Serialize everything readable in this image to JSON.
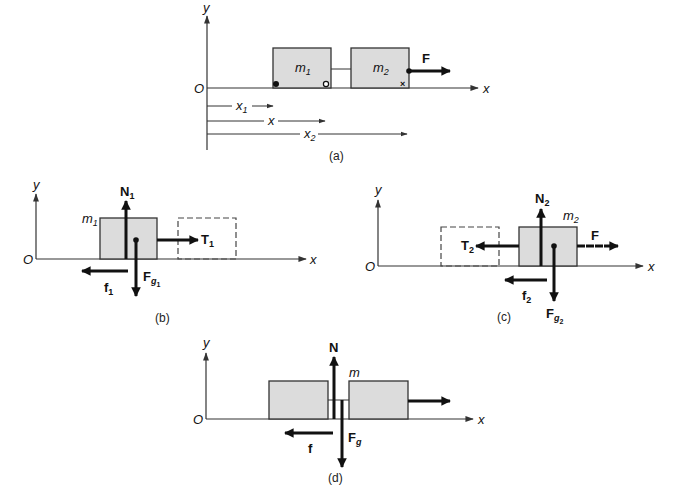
{
  "figure": {
    "panels": [
      {
        "caption": "(a)",
        "axis_labels": {
          "origin": "O",
          "x": "x",
          "y": "y"
        },
        "masses": [
          {
            "label": "m",
            "sub": "1"
          },
          {
            "label": "m",
            "sub": "2"
          }
        ],
        "force": {
          "label": "F"
        },
        "positions": [
          {
            "label": "x",
            "sub": "1"
          },
          {
            "label": "x",
            "sub": ""
          },
          {
            "label": "x",
            "sub": "2"
          }
        ],
        "markers": [
          "filled-dot",
          "open-circle",
          "cross"
        ]
      },
      {
        "caption": "(b)",
        "axis_labels": {
          "origin": "O",
          "x": "x",
          "y": "y"
        },
        "mass": {
          "label": "m",
          "sub": "1"
        },
        "forces": {
          "normal": {
            "label": "N",
            "sub": "1"
          },
          "tension": {
            "label": "T",
            "sub": "1"
          },
          "gravity": {
            "label": "F",
            "sub": "g",
            "subsub": "1"
          },
          "friction": {
            "label": "f",
            "sub": "1"
          }
        }
      },
      {
        "caption": "(c)",
        "axis_labels": {
          "origin": "O",
          "x": "x",
          "y": "y"
        },
        "mass": {
          "label": "m",
          "sub": "2"
        },
        "forces": {
          "normal": {
            "label": "N",
            "sub": "2"
          },
          "tension": {
            "label": "T",
            "sub": "2"
          },
          "applied": {
            "label": "F"
          },
          "gravity": {
            "label": "F",
            "sub": "g",
            "subsub": "2"
          },
          "friction": {
            "label": "f",
            "sub": "2"
          }
        }
      },
      {
        "caption": "(d)",
        "axis_labels": {
          "origin": "O",
          "x": "x",
          "y": "y"
        },
        "mass": {
          "label": "m"
        },
        "forces": {
          "normal": {
            "label": "N"
          },
          "gravity": {
            "label": "F",
            "sub": "g"
          },
          "friction": {
            "label": "f"
          }
        }
      }
    ],
    "colors": {
      "box_fill": "#dcdcdc",
      "stroke": "#111111",
      "background": "#ffffff"
    }
  }
}
